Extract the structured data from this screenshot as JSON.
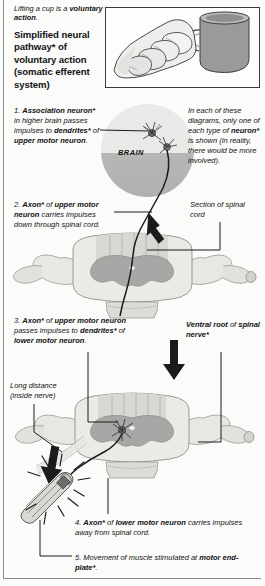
{
  "page": {
    "caption_lifting_plain": "Lifting a cup is a ",
    "caption_lifting_bold": "voluntary action",
    "caption_lifting_tail": ".",
    "title": "Simplified neural pathway* of voluntary action (somatic efferent system)"
  },
  "cup_box": {
    "name": "hand-lifting-cup-illustration",
    "cup_color": "#9a9a9a",
    "hand_color": "#efeeec"
  },
  "brain": {
    "label": "BRAIN",
    "upper_color": "#e9e9e7",
    "lower_color": "#b6b6b4"
  },
  "steps": {
    "step1": {
      "number": "1. ",
      "bold1": "Association neuron*",
      "mid1": " in higher brain passes impulses to ",
      "bold2": "dendrites*",
      "mid2": " of ",
      "bold3": "upper motor neuron",
      "tail": "."
    },
    "step2": {
      "number": "2. ",
      "bold1": "Axon*",
      "mid1": " of ",
      "bold2": "upper motor neuron",
      "tail": " carries impulses down through spinal cord."
    },
    "step3": {
      "number": "3. ",
      "bold1": "Axon*",
      "mid1": " of ",
      "bold2": "upper motor neuron",
      "mid2": " passes impulses to ",
      "bold3": "dendrites*",
      "mid3": " of ",
      "bold4": "lower motor neuron",
      "tail": "."
    },
    "step4": {
      "number": "4. ",
      "bold1": "Axon*",
      "mid1": " of ",
      "bold2": "lower motor neuron",
      "tail": " carries impulses away from spinal cord."
    },
    "step5": {
      "number": "5. ",
      "mid1": "Movement of muscle stimulated at ",
      "bold1": "motor end-plate*",
      "tail": "."
    }
  },
  "notes": {
    "each_diagram_1": "In each of these diagrams, only one of each type of ",
    "each_diagram_bold": "neuron*",
    "each_diagram_2": " is shown (in reality, there would be more involved).",
    "section_of": "Section of spinal cord",
    "ventral_bold": "Ventral root",
    "ventral_mid": " of ",
    "ventral_bold2": "spinal nerve*",
    "long_distance": "Long distance (inside nerve)"
  },
  "colors": {
    "ink": "#121212",
    "line": "#1b1b1b",
    "page_bg": "#fbfbfa",
    "grey_matter": "#a7a7a5",
    "white_matter": "#e4e3e0"
  }
}
